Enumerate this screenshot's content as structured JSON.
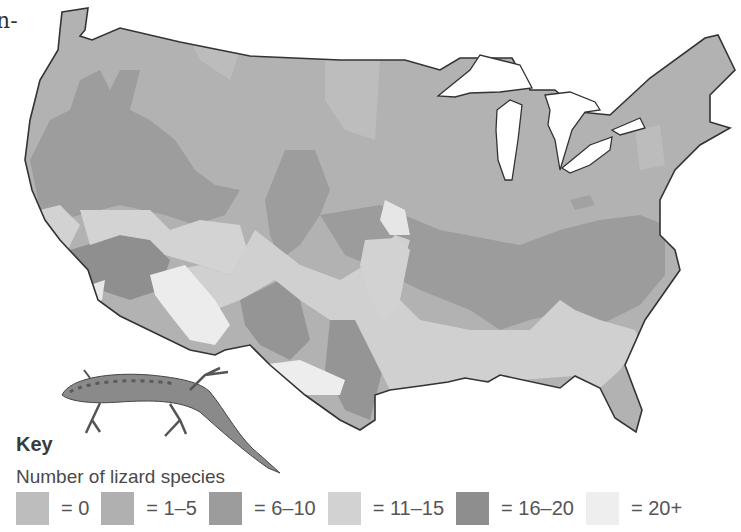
{
  "page_fragment": "n-",
  "map": {
    "subject": "Number of lizard species across the contiguous United States",
    "outline_color": "#333333",
    "illustration": "lizard"
  },
  "key": {
    "title": "Key",
    "subtitle": "Number of lizard species",
    "items": [
      {
        "label": "= 0",
        "color": "#bdbdbd"
      },
      {
        "label": "= 1–5",
        "color": "#b0b0b0"
      },
      {
        "label": "= 6–10",
        "color": "#9c9c9c"
      },
      {
        "label": "= 11–15",
        "color": "#d2d2d2"
      },
      {
        "label": "= 16–20",
        "color": "#8e8e8e"
      },
      {
        "label": "= 20+",
        "color": "#eeeeee"
      }
    ]
  }
}
